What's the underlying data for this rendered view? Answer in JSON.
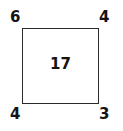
{
  "figure": {
    "type": "labeled-square-diagram",
    "shape": {
      "name": "square",
      "stroke_color": "#2a2a2a",
      "fill_color": "#ffffff"
    },
    "center_value": "17",
    "corner_labels": {
      "top_left": "6",
      "top_right": "4",
      "bottom_left": "4",
      "bottom_right": "3"
    },
    "text_color": "#141414",
    "background_color": "#ffffff"
  }
}
